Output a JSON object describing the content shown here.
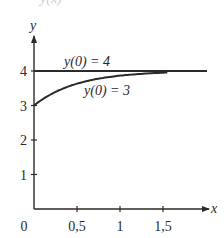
{
  "clipped_top_text": "y(x)",
  "chart_data": {
    "type": "line",
    "title": "",
    "xlabel": "x",
    "ylabel": "y",
    "xlim": [
      0,
      2
    ],
    "ylim": [
      0,
      5
    ],
    "grid": false,
    "legend": null,
    "x_ticks": [
      0,
      0.5,
      1,
      1.5
    ],
    "x_tick_labels": [
      "0",
      "0,5",
      "1",
      "1,5"
    ],
    "y_ticks": [
      1,
      2,
      3,
      4
    ],
    "y_tick_labels": [
      "1",
      "2",
      "3",
      "4"
    ],
    "series": [
      {
        "name": "y(0) = 4",
        "x": [
          0,
          0.5,
          1,
          1.5,
          2
        ],
        "values": [
          4,
          4,
          4,
          4,
          4
        ]
      },
      {
        "name": "y(0) = 3",
        "x": [
          0,
          0.25,
          0.5,
          0.75,
          1,
          1.25,
          1.5
        ],
        "values": [
          3,
          3.39,
          3.63,
          3.78,
          3.86,
          3.92,
          3.95
        ]
      }
    ],
    "annotations": [
      {
        "text": "y(0) = 4",
        "x": 0.7,
        "y": 4.2
      },
      {
        "text": "y(0) = 3",
        "x": 0.95,
        "y": 3.45
      }
    ]
  }
}
